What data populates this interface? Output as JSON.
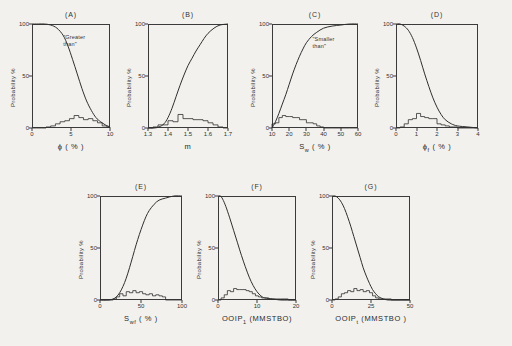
{
  "figure": {
    "background_color": "#f2f1ee",
    "ink_color": "#2f2f2f",
    "y_axis_label": "Probability %",
    "y_ticks": [
      "100",
      "50",
      "0"
    ]
  },
  "chart_data": [
    {
      "type": "line",
      "panel": "(A)",
      "title": "(A)",
      "xlabel": "ϕ ( % )",
      "ylabel": "Probability %",
      "annotation": "\"Greater\nthan\"",
      "xlim": [
        0,
        10
      ],
      "ylim": [
        0,
        100
      ],
      "xticks": [
        "0",
        "5",
        "10"
      ],
      "xtick_values": [
        0,
        5,
        10
      ],
      "yticks": [
        "0",
        "50",
        "100"
      ],
      "grid": false,
      "legend": "none",
      "series": [
        {
          "name": "cumulative-greater-than",
          "kind": "curve",
          "x": [
            0,
            0.8,
            1.6,
            2.4,
            3.2,
            4.0,
            4.6,
            5.2,
            5.8,
            6.4,
            7.0,
            7.6,
            8.2,
            8.8,
            9.4,
            10
          ],
          "values": [
            100,
            100,
            100,
            99,
            96,
            89,
            79,
            66,
            52,
            38,
            26,
            17,
            10,
            6,
            3,
            1
          ]
        },
        {
          "name": "frequency-histogram",
          "kind": "histogram",
          "bin_edges": [
            0,
            0.6,
            1.2,
            1.8,
            2.4,
            3.0,
            3.6,
            4.2,
            4.8,
            5.4,
            6.0,
            6.6,
            7.2,
            7.8,
            8.4,
            9.0,
            9.6,
            10
          ],
          "values": [
            0,
            0,
            0,
            1,
            2,
            4,
            6,
            7,
            9,
            12,
            10,
            8,
            9,
            7,
            5,
            2,
            1
          ]
        }
      ]
    },
    {
      "type": "line",
      "panel": "(B)",
      "title": "(B)",
      "xlabel": "m",
      "ylabel": "Probability %",
      "annotation": "",
      "xlim": [
        1.3,
        1.7
      ],
      "ylim": [
        0,
        100
      ],
      "xticks": [
        "1.3",
        "1.4",
        "1.5",
        "1.6",
        "1.7"
      ],
      "xtick_values": [
        1.3,
        1.4,
        1.5,
        1.6,
        1.7
      ],
      "yticks": [
        "0",
        "50",
        "100"
      ],
      "grid": false,
      "legend": "none",
      "series": [
        {
          "name": "cumulative-curve",
          "kind": "curve",
          "x": [
            1.3,
            1.33,
            1.355,
            1.38,
            1.4,
            1.42,
            1.44,
            1.46,
            1.48,
            1.5,
            1.52,
            1.54,
            1.56,
            1.58,
            1.6,
            1.63,
            1.66,
            1.7
          ],
          "values": [
            0,
            0,
            1,
            4,
            10,
            19,
            30,
            41,
            51,
            60,
            67,
            74,
            80,
            86,
            91,
            96,
            99,
            100
          ]
        },
        {
          "name": "frequency-histogram",
          "kind": "histogram",
          "bin_edges": [
            1.3,
            1.325,
            1.35,
            1.375,
            1.4,
            1.425,
            1.45,
            1.475,
            1.5,
            1.525,
            1.55,
            1.575,
            1.6,
            1.625,
            1.65,
            1.675,
            1.7
          ],
          "values": [
            0,
            1,
            3,
            3,
            7,
            6,
            13,
            9,
            9,
            8,
            8,
            7,
            5,
            3,
            1,
            0
          ]
        }
      ]
    },
    {
      "type": "line",
      "panel": "(C)",
      "title": "(C)",
      "xlabel": "S_w ( % )",
      "xlabel_base": "S",
      "xlabel_sub": "w",
      "xlabel_unit": "( % )",
      "ylabel": "Probability %",
      "annotation": "\"Smaller\nthan\"",
      "xlim": [
        10,
        60
      ],
      "ylim": [
        0,
        100
      ],
      "xticks": [
        "10",
        "20",
        "30",
        "40",
        "50",
        "60"
      ],
      "xtick_values": [
        10,
        20,
        30,
        40,
        50,
        60
      ],
      "yticks": [
        "0",
        "50",
        "100"
      ],
      "grid": false,
      "legend": "none",
      "series": [
        {
          "name": "cumulative-smaller-than",
          "kind": "curve",
          "x": [
            10,
            12,
            14,
            16,
            18,
            20,
            22,
            24,
            26,
            28,
            30,
            33,
            36,
            40,
            45,
            50,
            55,
            60
          ],
          "values": [
            0,
            6,
            14,
            23,
            32,
            42,
            52,
            61,
            69,
            76,
            82,
            88,
            92,
            96,
            98,
            99,
            100,
            100
          ]
        },
        {
          "name": "frequency-histogram",
          "kind": "histogram",
          "bin_edges": [
            10,
            12,
            14,
            16,
            18,
            20,
            22,
            24,
            26,
            28,
            30,
            32,
            34,
            36,
            38,
            40,
            45,
            50,
            55,
            60
          ],
          "values": [
            4,
            5,
            10,
            12,
            11,
            11,
            10,
            10,
            8,
            8,
            5,
            5,
            4,
            2,
            1,
            0,
            0,
            0,
            0
          ]
        }
      ]
    },
    {
      "type": "line",
      "panel": "(D)",
      "title": "(D)",
      "xlabel": "ϕ_f ( % )",
      "xlabel_base": "ϕ",
      "xlabel_sub": "f",
      "xlabel_unit": "( % )",
      "ylabel": "Probability %",
      "annotation": "",
      "xlim": [
        0,
        4
      ],
      "ylim": [
        0,
        100
      ],
      "xticks": [
        "0",
        "1",
        "2",
        "3",
        "4"
      ],
      "xtick_values": [
        0,
        1,
        2,
        3,
        4
      ],
      "yticks": [
        "0",
        "50",
        "100"
      ],
      "grid": false,
      "legend": "none",
      "series": [
        {
          "name": "cumulative-curve",
          "kind": "curve",
          "x": [
            0,
            0.2,
            0.4,
            0.6,
            0.8,
            1.0,
            1.2,
            1.4,
            1.6,
            1.8,
            2.0,
            2.2,
            2.4,
            2.7,
            3.0,
            3.5,
            4.0
          ],
          "values": [
            100,
            100,
            98,
            94,
            87,
            77,
            65,
            52,
            40,
            29,
            20,
            13,
            8,
            4,
            2,
            1,
            0
          ]
        },
        {
          "name": "frequency-histogram",
          "kind": "histogram",
          "bin_edges": [
            0,
            0.2,
            0.4,
            0.6,
            0.8,
            1.0,
            1.2,
            1.4,
            1.6,
            1.8,
            2.0,
            2.2,
            2.4,
            2.6,
            2.8,
            3.0,
            3.4,
            3.8,
            4.0
          ],
          "values": [
            0,
            1,
            4,
            8,
            9,
            14,
            11,
            10,
            9,
            9,
            4,
            3,
            2,
            1,
            1,
            0,
            0,
            0
          ]
        }
      ]
    },
    {
      "type": "line",
      "panel": "(E)",
      "title": "(E)",
      "xlabel": "S_wf ( % )",
      "xlabel_base": "S",
      "xlabel_sub": "wf",
      "xlabel_unit": "( % )",
      "ylabel": "Probability %",
      "annotation": "",
      "xlim": [
        0,
        100
      ],
      "ylim": [
        0,
        100
      ],
      "xticks": [
        "0",
        "50",
        "100"
      ],
      "xtick_values": [
        0,
        50,
        100
      ],
      "yticks": [
        "0",
        "50",
        "100"
      ],
      "grid": false,
      "legend": "none",
      "series": [
        {
          "name": "cumulative-curve",
          "kind": "curve",
          "x": [
            0,
            10,
            16,
            20,
            24,
            28,
            32,
            36,
            40,
            44,
            48,
            52,
            56,
            60,
            66,
            72,
            80,
            90,
            100
          ],
          "values": [
            0,
            0,
            1,
            3,
            7,
            13,
            21,
            31,
            42,
            53,
            63,
            72,
            80,
            86,
            92,
            96,
            98,
            100,
            100
          ]
        },
        {
          "name": "frequency-histogram",
          "kind": "histogram",
          "bin_edges": [
            0,
            8,
            16,
            20,
            24,
            28,
            32,
            36,
            40,
            44,
            48,
            52,
            56,
            60,
            64,
            68,
            72,
            76,
            80,
            90,
            100
          ],
          "values": [
            0,
            0,
            1,
            3,
            6,
            4,
            8,
            7,
            9,
            7,
            8,
            6,
            5,
            6,
            4,
            5,
            4,
            3,
            0,
            0
          ]
        }
      ]
    },
    {
      "type": "line",
      "panel": "(F)",
      "title": "(F)",
      "xlabel": "OOIP_1 (MMSTBO)",
      "xlabel_base": "OOIP",
      "xlabel_sub": "1",
      "xlabel_unit": "(MMSTBO)",
      "ylabel": "Probability %",
      "annotation": "",
      "xlim": [
        0,
        20
      ],
      "ylim": [
        0,
        100
      ],
      "xticks": [
        "0",
        "10",
        "20"
      ],
      "xtick_values": [
        0,
        10,
        20
      ],
      "yticks": [
        "0",
        "50",
        "100"
      ],
      "grid": false,
      "legend": "none",
      "series": [
        {
          "name": "cumulative-curve",
          "kind": "curve",
          "x": [
            0,
            0.6,
            1.2,
            2,
            3,
            4,
            5,
            6,
            7,
            8,
            9,
            10,
            11,
            12,
            14,
            16,
            18,
            20
          ],
          "values": [
            100,
            100,
            97,
            90,
            79,
            67,
            55,
            43,
            32,
            22,
            14,
            8,
            4,
            2,
            1,
            0,
            0,
            0
          ]
        },
        {
          "name": "frequency-histogram",
          "kind": "histogram",
          "bin_edges": [
            0,
            0.8,
            1.6,
            2.4,
            3.2,
            4.0,
            4.8,
            5.6,
            6.4,
            7.2,
            8.0,
            8.8,
            9.6,
            10.4,
            11.2,
            12,
            13,
            14,
            16,
            18,
            20
          ],
          "values": [
            0,
            2,
            5,
            9,
            8,
            11,
            10,
            10,
            10,
            9,
            8,
            6,
            4,
            3,
            2,
            2,
            1,
            1,
            1,
            0
          ]
        }
      ]
    },
    {
      "type": "line",
      "panel": "(G)",
      "title": "(G)",
      "xlabel": "OOIP_t (MMSTBO )",
      "xlabel_base": "OOIP",
      "xlabel_sub": "t",
      "xlabel_unit": "(MMSTBO )",
      "ylabel": "Probability %",
      "annotation": "",
      "xlim": [
        0,
        50
      ],
      "ylim": [
        0,
        100
      ],
      "xticks": [
        "0",
        "25",
        "50"
      ],
      "xtick_values": [
        0,
        25,
        50
      ],
      "yticks": [
        "0",
        "50",
        "100"
      ],
      "grid": false,
      "legend": "none",
      "series": [
        {
          "name": "cumulative-curve",
          "kind": "curve",
          "x": [
            0,
            2,
            4,
            6,
            8,
            10,
            12,
            14,
            16,
            18,
            20,
            22,
            24,
            26,
            28,
            30,
            33,
            36,
            40,
            50
          ],
          "values": [
            100,
            100,
            98,
            94,
            88,
            80,
            71,
            61,
            51,
            41,
            31,
            23,
            16,
            10,
            6,
            3,
            1,
            0,
            0,
            0
          ]
        },
        {
          "name": "frequency-histogram",
          "kind": "histogram",
          "bin_edges": [
            0,
            2,
            4,
            6,
            8,
            10,
            12,
            14,
            16,
            18,
            20,
            22,
            24,
            26,
            28,
            30,
            34,
            38,
            42,
            46,
            50
          ],
          "values": [
            0,
            1,
            3,
            6,
            7,
            9,
            8,
            11,
            9,
            10,
            8,
            9,
            7,
            4,
            2,
            1,
            1,
            0,
            0,
            0
          ]
        }
      ]
    }
  ]
}
